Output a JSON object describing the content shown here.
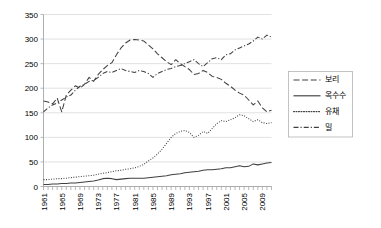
{
  "chart_data": {
    "type": "line",
    "title": "",
    "xlabel": "",
    "ylabel": "",
    "grid": true,
    "legend_position": "right",
    "ylim": [
      0,
      350
    ],
    "ytick_values": [
      0,
      50,
      100,
      150,
      200,
      250,
      300,
      350
    ],
    "ytick_labels": [
      "0",
      "50",
      "100",
      "150",
      "200",
      "250",
      "300",
      "350"
    ],
    "xlim": [
      1961,
      2011
    ],
    "x": [
      1961,
      1962,
      1963,
      1964,
      1965,
      1966,
      1967,
      1968,
      1969,
      1970,
      1971,
      1972,
      1973,
      1974,
      1975,
      1976,
      1977,
      1978,
      1979,
      1980,
      1981,
      1982,
      1983,
      1984,
      1985,
      1986,
      1987,
      1988,
      1989,
      1990,
      1991,
      1992,
      1993,
      1994,
      1995,
      1996,
      1997,
      1998,
      1999,
      2000,
      2001,
      2002,
      2003,
      2004,
      2005,
      2006,
      2007,
      2008,
      2009,
      2010,
      2011
    ],
    "xtick_labels": [
      "1961",
      "1965",
      "1969",
      "1973",
      "1977",
      "1981",
      "1985",
      "1989",
      "1993",
      "1997",
      "2001",
      "2005",
      "2009"
    ],
    "xtick_values": [
      1961,
      1965,
      1969,
      1973,
      1977,
      1981,
      1985,
      1989,
      1993,
      1997,
      2001,
      2005,
      2009
    ],
    "series": [
      {
        "name": "보리",
        "dash": "long-dash",
        "color": "#404040",
        "values": [
          174,
          172,
          168,
          180,
          152,
          186,
          196,
          205,
          200,
          208,
          222,
          214,
          228,
          238,
          246,
          252,
          268,
          282,
          292,
          298,
          299,
          298,
          296,
          288,
          280,
          270,
          262,
          254,
          248,
          258,
          250,
          244,
          238,
          228,
          230,
          236,
          232,
          224,
          222,
          218,
          210,
          204,
          196,
          190,
          186,
          176,
          166,
          174,
          160,
          152,
          155
        ]
      },
      {
        "name": "옥수수",
        "dash": "solid",
        "color": "#404040",
        "values": [
          4,
          4,
          5,
          5,
          6,
          6,
          7,
          7,
          8,
          9,
          10,
          11,
          13,
          16,
          17,
          16,
          14,
          15,
          16,
          17,
          17,
          17,
          17,
          18,
          19,
          20,
          21,
          22,
          24,
          25,
          26,
          28,
          29,
          30,
          31,
          33,
          34,
          34,
          35,
          36,
          38,
          38,
          40,
          42,
          40,
          41,
          46,
          44,
          46,
          48,
          49
        ]
      },
      {
        "name": "유채",
        "dash": "dotted",
        "color": "#404040",
        "values": [
          14,
          14,
          15,
          16,
          16,
          17,
          18,
          19,
          20,
          21,
          22,
          23,
          25,
          27,
          28,
          30,
          32,
          33,
          35,
          36,
          38,
          41,
          45,
          52,
          58,
          66,
          76,
          88,
          100,
          108,
          112,
          114,
          110,
          100,
          104,
          112,
          108,
          118,
          128,
          134,
          132,
          136,
          140,
          146,
          144,
          138,
          132,
          136,
          130,
          128,
          130
        ]
      },
      {
        "name": "밀",
        "dash": "dash-dot",
        "color": "#404040",
        "values": [
          152,
          160,
          166,
          170,
          176,
          182,
          186,
          196,
          204,
          208,
          214,
          216,
          222,
          230,
          234,
          232,
          236,
          240,
          236,
          234,
          232,
          236,
          234,
          230,
          222,
          230,
          234,
          238,
          240,
          244,
          246,
          250,
          254,
          258,
          250,
          244,
          252,
          260,
          262,
          258,
          268,
          270,
          278,
          282,
          286,
          290,
          296,
          304,
          300,
          308,
          304
        ]
      }
    ],
    "legend_entries": [
      {
        "label": "보리",
        "dash": "long-dash"
      },
      {
        "label": "옥수수",
        "dash": "solid"
      },
      {
        "label": "유채",
        "dash": "dotted"
      },
      {
        "label": "밀",
        "dash": "dash-dot"
      }
    ]
  }
}
